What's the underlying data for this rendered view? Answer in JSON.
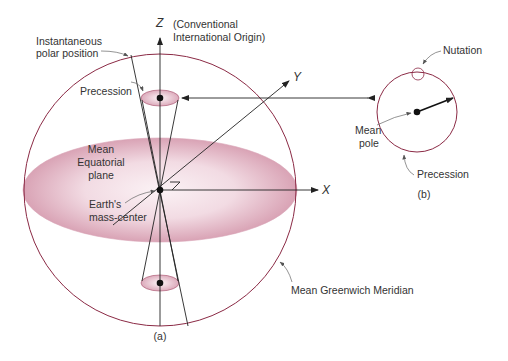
{
  "figure": {
    "colors": {
      "sphere_outline": "#8b2a45",
      "plane_fill_edge": "#d9a3b5",
      "plane_fill_center": "#fbf2f5",
      "line": "#222222",
      "text": "#333333"
    },
    "panel_a": {
      "caption": "(a)",
      "axes": {
        "z": "Z",
        "y": "Y",
        "x": "X"
      },
      "z_annotation_line1": "(Conventional",
      "z_annotation_line2": "International Origin)",
      "instantaneous_line1": "Instantaneous",
      "instantaneous_line2": "polar position",
      "precession": "Precession",
      "plane_line1": "Mean",
      "plane_line2": "Equatorial",
      "plane_line3": "plane",
      "center_line1": "Earth's",
      "center_line2": "mass-center",
      "meridian": "Mean Greenwich Meridian"
    },
    "panel_b": {
      "caption": "(b)",
      "nutation": "Nutation",
      "mean_pole_line1": "Mean",
      "mean_pole_line2": "pole",
      "precession": "Precession"
    }
  }
}
